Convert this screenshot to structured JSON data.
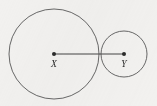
{
  "figure": {
    "background_color": "#f2f1ef",
    "stroke_color": "#585858",
    "segment_color": "#454545",
    "dot_color": "#2b2b2b",
    "label_color": "#2b2b2b",
    "width": 157,
    "height": 106
  },
  "chart_data": {
    "type": "diagram",
    "title": "",
    "subtitle": "",
    "xlabel": "",
    "ylabel": "",
    "shapes": [
      {
        "kind": "circle",
        "name": "large-circle",
        "center_label": "X",
        "cx": 54,
        "cy": 54,
        "r": 45
      },
      {
        "kind": "circle",
        "name": "small-circle",
        "center_label": "Y",
        "cx": 124,
        "cy": 54,
        "r": 23
      },
      {
        "kind": "segment",
        "name": "center-segment",
        "x1": 54,
        "y1": 54,
        "x2": 124,
        "y2": 54,
        "length": 70
      }
    ],
    "points": [
      {
        "name": "center-x",
        "label": "X",
        "x": 54,
        "y": 54,
        "label_x": 54,
        "label_y": 67
      },
      {
        "name": "center-y",
        "label": "Y",
        "x": 124,
        "y": 54,
        "label_x": 124,
        "label_y": 67
      }
    ],
    "tangency": {
      "name": "tangent-point",
      "x": 99,
      "y": 54,
      "external": true
    },
    "grid": false,
    "legend": null,
    "annotations": []
  },
  "labels": {
    "point_x": "X",
    "point_y": "Y"
  }
}
